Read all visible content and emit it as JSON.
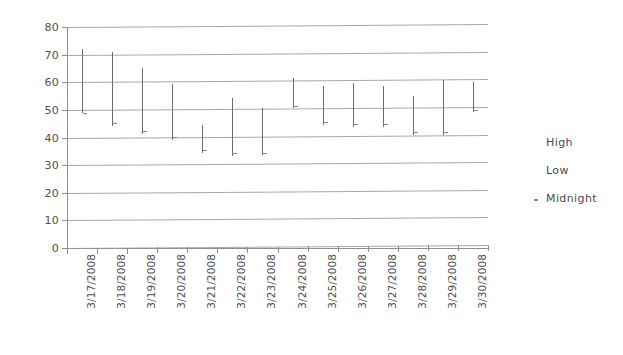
{
  "chart_data": {
    "type": "bar",
    "subtype": "high-low-close range",
    "title": "",
    "xlabel": "",
    "ylabel": "",
    "ylim": [
      0,
      80
    ],
    "ytick_step": 10,
    "yticks": [
      80,
      70,
      60,
      50,
      40,
      30,
      20,
      10,
      0
    ],
    "grid": true,
    "legend_position": "right",
    "legend": [
      "High",
      "Low",
      "Midnight"
    ],
    "categories": [
      "3/17/2008",
      "3/18/2008",
      "3/19/2008",
      "3/20/2008",
      "3/21/2008",
      "3/22/2008",
      "3/23/2008",
      "3/24/2008",
      "3/25/2008",
      "3/26/2008",
      "3/27/2008",
      "3/28/2008",
      "3/29/2008",
      "3/30/2008"
    ],
    "series": [
      {
        "name": "High",
        "values": [
          72,
          71,
          65,
          59,
          44,
          54,
          50,
          61,
          58,
          59,
          58,
          54,
          60,
          59
        ]
      },
      {
        "name": "Low",
        "values": [
          49,
          44,
          41,
          39,
          34,
          33,
          33,
          50,
          44,
          43,
          43,
          40,
          40,
          48
        ]
      },
      {
        "name": "Midnight",
        "values": [
          49,
          45,
          42,
          40,
          35,
          34,
          34,
          51,
          45,
          44,
          44,
          41,
          41,
          49
        ]
      }
    ]
  },
  "axis": {
    "y_labels": [
      "80",
      "70",
      "60",
      "50",
      "40",
      "30",
      "20",
      "10",
      "0"
    ],
    "x_labels": [
      "3/17/2008",
      "3/18/2008",
      "3/19/2008",
      "3/20/2008",
      "3/21/2008",
      "3/22/2008",
      "3/23/2008",
      "3/24/2008",
      "3/25/2008",
      "3/26/2008",
      "3/27/2008",
      "3/28/2008",
      "3/29/2008",
      "3/30/2008"
    ]
  },
  "legend": {
    "items": [
      {
        "label": "High",
        "marker": "line-marker"
      },
      {
        "label": "Low",
        "marker": "line-marker"
      },
      {
        "label": "Midnight",
        "marker": "dot-marker"
      }
    ]
  },
  "colors": {
    "bar": "#6d6d6d",
    "grid": "#9a9a9a",
    "axis": "#8e8e8e",
    "text": "#4a4a4a",
    "background": "#ffffff"
  }
}
